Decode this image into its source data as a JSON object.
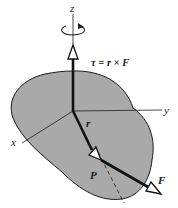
{
  "diagram": {
    "colors": {
      "body_fill": "#a9a9a9",
      "outline": "#1a1a1a",
      "background": "#ffffff"
    },
    "labels": {
      "z_axis": "z",
      "y_axis": "y",
      "x_axis": "x",
      "torque_equation": "τ = r × F",
      "position_vector": "r",
      "point": "P",
      "force": "F"
    },
    "icons": {
      "rotation": "counterclockwise-rotation-arrow-icon"
    }
  }
}
